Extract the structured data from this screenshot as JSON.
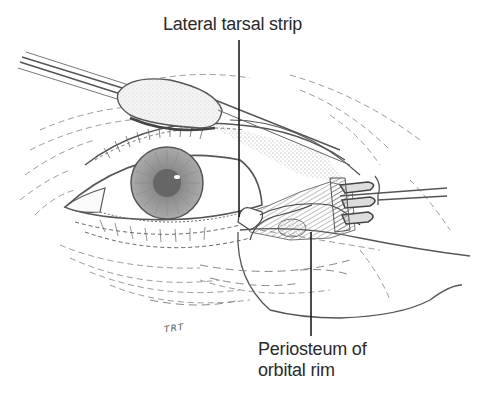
{
  "figure": {
    "colors": {
      "ink": "#4a4a4a",
      "leader_line": "#1e1e1e",
      "label_text": "#2a2a2a",
      "background": "#ffffff"
    }
  },
  "labels": {
    "top": "Lateral tarsal strip",
    "bottom_line1": "Periosteum of",
    "bottom_line2": "orbital rim"
  },
  "signature": "TRT",
  "instruments": [
    {
      "name": "cotton-tipped applicator",
      "position": "upper-left"
    },
    {
      "name": "rake retractor",
      "position": "right"
    }
  ]
}
